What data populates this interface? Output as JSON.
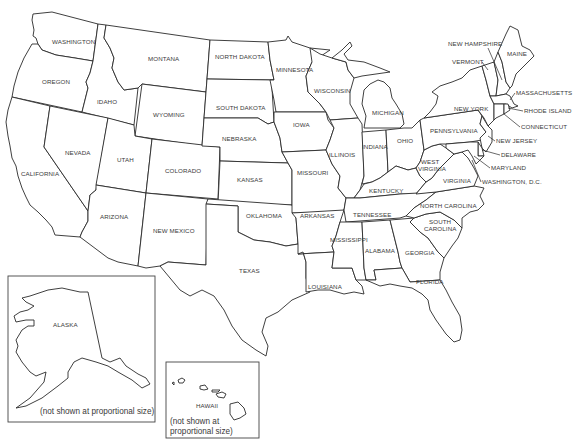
{
  "map": {
    "title": "United States outline map",
    "colors": {
      "fill": "#ffffff",
      "stroke": "#2a2a2a",
      "label": "#3a3a3a"
    },
    "states": {
      "washington": "WASHINGTON",
      "oregon": "OREGON",
      "california": "CALIFORNIA",
      "idaho": "IDAHO",
      "nevada": "NEVADA",
      "montana": "MONTANA",
      "wyoming": "WYOMING",
      "utah": "UTAH",
      "colorado": "COLORADO",
      "arizona": "ARIZONA",
      "new_mexico": "NEW MEXICO",
      "north_dakota": "NORTH DAKOTA",
      "south_dakota": "SOUTH DAKOTA",
      "nebraska": "NEBRASKA",
      "kansas": "KANSAS",
      "oklahoma": "OKLAHOMA",
      "texas": "TEXAS",
      "minnesota": "MINNESOTA",
      "iowa": "IOWA",
      "missouri": "MISSOURI",
      "arkansas": "ARKANSAS",
      "louisiana": "LOUISIANA",
      "wisconsin": "WISCONSIN",
      "illinois": "ILLINOIS",
      "michigan": "MICHIGAN",
      "indiana": "INDIANA",
      "ohio": "OHIO",
      "kentucky": "KENTUCKY",
      "tennessee": "TENNESSEE",
      "mississippi": "MISSISSIPPI",
      "alabama": "ALABAMA",
      "georgia": "GEORGIA",
      "florida": "FLORIDA",
      "south_carolina_1": "SOUTH",
      "south_carolina_2": "CAROLINA",
      "north_carolina": "NORTH CAROLINA",
      "virginia": "VIRGINIA",
      "west_virginia_1": "WEST",
      "west_virginia_2": "VIRGINIA",
      "pennsylvania": "PENNSYLVANIA",
      "new_york": "NEW YORK",
      "vermont": "VERMONT",
      "new_hampshire": "NEW HAMPSHIRE",
      "maine": "MAINE",
      "massachusetts": "MASSACHUSETTS",
      "rhode_island": "RHODE ISLAND",
      "connecticut": "CONNECTICUT",
      "new_jersey": "NEW JERSEY",
      "delaware": "DELAWARE",
      "maryland": "MARYLAND",
      "washington_dc": "WASHINGTON, D.C.",
      "alaska": "ALASKA",
      "hawaii": "HAWAII"
    },
    "insets": {
      "alaska_note": "(not shown at proportional size)",
      "hawaii_note_1": "(not shown at",
      "hawaii_note_2": "proportional size)"
    }
  }
}
